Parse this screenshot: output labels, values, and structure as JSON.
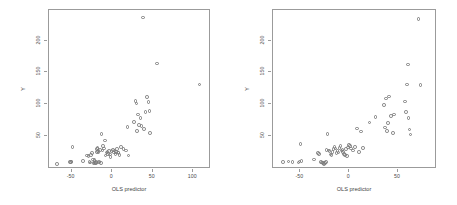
{
  "figure": {
    "width": 457,
    "height": 205,
    "background": "#ffffff",
    "point_color": "#7d7d7d",
    "axis_color": "#9b9b9b",
    "text_color": "#3f3f3f"
  },
  "panels": [
    {
      "id": "left",
      "xlabel": "OLS predictor",
      "ylabel": "Y",
      "xticks": [
        "-50",
        "0",
        "50",
        "100"
      ],
      "xtick_values": [
        -50,
        0,
        50,
        100
      ],
      "yticks": [
        "50",
        "100",
        "150",
        "200"
      ],
      "ytick_values": [
        50,
        100,
        150,
        200
      ],
      "xlim": [
        -78,
        122
      ],
      "ylim": [
        -2,
        248
      ]
    },
    {
      "id": "right",
      "xlabel": "OLS predictor",
      "ylabel": "Y",
      "xticks": [
        "-50",
        "0",
        "50"
      ],
      "xtick_values": [
        -50,
        0,
        50
      ],
      "yticks": [
        "50",
        "100",
        "150",
        "200"
      ],
      "ytick_values": [
        50,
        100,
        150,
        200
      ],
      "xlim": [
        -78,
        90
      ],
      "ylim": [
        -2,
        248
      ]
    }
  ],
  "chart_data": [
    {
      "type": "scatter",
      "panel": "left",
      "title": "",
      "xlabel": "OLS predictor",
      "ylabel": "Y",
      "xlim": [
        -78,
        122
      ],
      "ylim": [
        -2,
        248
      ],
      "xticks": [
        -50,
        0,
        50,
        100
      ],
      "yticks": [
        50,
        100,
        150,
        200
      ],
      "grid": false,
      "legend": "none",
      "marker": "open-circle",
      "series": [
        {
          "name": "observations",
          "x": [
            -68,
            -52,
            -51,
            -50,
            -49,
            -36,
            -31,
            -29,
            -28,
            -27,
            -26,
            -25,
            -24,
            -23,
            -22,
            -22,
            -21,
            -20,
            -20,
            -19,
            -19,
            -18,
            -18,
            -17,
            -17,
            -16,
            -16,
            -15,
            -14,
            -13,
            -12,
            -11,
            -10,
            -9,
            -8,
            -7,
            -6,
            -5,
            -4,
            -3,
            -2,
            -1,
            1,
            2,
            3,
            4,
            5,
            6,
            7,
            8,
            9,
            11,
            14,
            17,
            19,
            20,
            27,
            29,
            30,
            31,
            32,
            33,
            35,
            36,
            38,
            39,
            41,
            43,
            45,
            46,
            47,
            55,
            108
          ],
          "y": [
            6,
            9,
            9,
            10,
            33,
            11,
            19,
            18,
            9,
            8,
            20,
            23,
            13,
            7,
            8,
            12,
            7,
            7,
            9,
            25,
            29,
            26,
            31,
            24,
            27,
            8,
            10,
            28,
            7,
            53,
            27,
            34,
            30,
            43,
            19,
            24,
            25,
            22,
            26,
            21,
            17,
            26,
            28,
            24,
            27,
            22,
            25,
            29,
            24,
            23,
            20,
            33,
            29,
            27,
            64,
            19,
            72,
            105,
            101,
            58,
            84,
            67,
            78,
            66,
            236,
            61,
            88,
            111,
            103,
            89,
            55,
            164,
            131
          ]
        }
      ]
    },
    {
      "type": "scatter",
      "panel": "right",
      "title": "",
      "xlabel": "OLS predictor",
      "ylabel": "Y",
      "xlim": [
        -78,
        90
      ],
      "ylim": [
        -2,
        248
      ],
      "xticks": [
        -50,
        0,
        50
      ],
      "yticks": [
        50,
        100,
        150,
        200
      ],
      "grid": false,
      "legend": "none",
      "marker": "open-circle",
      "series": [
        {
          "name": "observations",
          "x": [
            -68,
            -62,
            -58,
            -52,
            -51,
            -50,
            -49,
            -36,
            -32,
            -31,
            -29,
            -28,
            -27,
            -26,
            -25,
            -24,
            -23,
            -22,
            -21,
            -20,
            -19,
            -18,
            -17,
            -16,
            -15,
            -14,
            -13,
            -12,
            -11,
            -10,
            -9,
            -8,
            -7,
            -6,
            -5,
            -4,
            -3,
            -2,
            -1,
            0,
            1,
            2,
            4,
            6,
            8,
            10,
            12,
            14,
            21,
            27,
            36,
            37,
            38,
            39,
            40,
            41,
            43,
            45,
            46,
            57,
            58,
            59,
            60,
            61,
            62,
            63,
            71,
            73
          ],
          "y": [
            9,
            10,
            9,
            8,
            10,
            37,
            11,
            13,
            23,
            22,
            9,
            8,
            7,
            6,
            7,
            9,
            28,
            53,
            27,
            26,
            21,
            20,
            25,
            29,
            33,
            30,
            23,
            26,
            24,
            31,
            34,
            27,
            28,
            25,
            22,
            20,
            29,
            18,
            32,
            36,
            34,
            30,
            27,
            33,
            62,
            25,
            57,
            31,
            71,
            80,
            99,
            63,
            109,
            58,
            70,
            112,
            81,
            55,
            84,
            104,
            88,
            131,
            162,
            78,
            60,
            52,
            234,
            130
          ]
        }
      ]
    }
  ]
}
